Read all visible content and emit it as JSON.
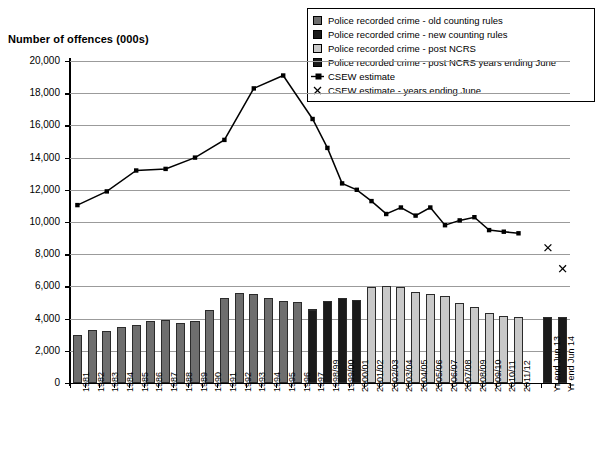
{
  "axis": {
    "y_title": "Number of offences (000s)",
    "y_ticks": [
      "0",
      "2,000",
      "4,000",
      "6,000",
      "8,000",
      "10,000",
      "12,000",
      "14,000",
      "16,000",
      "18,000",
      "20,000"
    ]
  },
  "legend": {
    "items": [
      {
        "label": "Police recorded crime - old counting rules",
        "marker": "square-swatch",
        "color": "#6e6e6e"
      },
      {
        "label": "Police recorded crime - new counting rules",
        "marker": "square-swatch",
        "color": "#1a1a1a"
      },
      {
        "label": "Police recorded crime - post NCRS",
        "marker": "square-swatch",
        "color": "#c9c9c9"
      },
      {
        "label": "Police recorded crime - post NCRS years ending June",
        "marker": "square-swatch",
        "color": "#1a1a1a"
      },
      {
        "label": "CSEW estimate",
        "marker": "line-point-marker",
        "color": "#000000"
      },
      {
        "label": "CSEW estimate - years ending June",
        "marker": "cross-marker",
        "color": "#000000"
      }
    ]
  },
  "chart_data": {
    "type": "bar",
    "title": "",
    "xlabel": "",
    "ylabel": "Number of offences (000s)",
    "ylim": [
      0,
      20000
    ],
    "grid": true,
    "legend_position": "top-right",
    "categories": [
      "1981",
      "1982",
      "1983",
      "1984",
      "1985",
      "1986",
      "1987",
      "1988",
      "1989",
      "1990",
      "1991",
      "1992",
      "1993",
      "1994",
      "1995",
      "1996",
      "1997",
      "1998/99",
      "1999/00",
      "2000/01",
      "2001/02",
      "2002/03",
      "2003/04",
      "2004/05",
      "2005/06",
      "2006/07",
      "2007/08",
      "2008/09",
      "2009/10",
      "2010/11",
      "2011/12",
      "",
      "Yr end Jun 13",
      "Yr end Jun 14"
    ],
    "series": [
      {
        "name": "Police recorded crime - old counting rules",
        "type": "bar",
        "color": "#6e6e6e",
        "values": [
          2963,
          3262,
          3247,
          3499,
          3612,
          3847,
          3892,
          3716,
          3870,
          4544,
          5276,
          5592,
          5526,
          5253,
          5100,
          5036,
          4598,
          null,
          null,
          null,
          null,
          null,
          null,
          null,
          null,
          null,
          null,
          null,
          null,
          null,
          null,
          null,
          null,
          null
        ]
      },
      {
        "name": "Police recorded crime - new counting rules",
        "type": "bar",
        "color": "#1a1a1a",
        "values": [
          null,
          null,
          null,
          null,
          null,
          null,
          null,
          null,
          null,
          null,
          null,
          null,
          null,
          null,
          null,
          null,
          4545,
          5109,
          5301,
          5171,
          5527,
          null,
          null,
          null,
          null,
          null,
          null,
          null,
          null,
          null,
          null,
          null,
          null,
          null
        ]
      },
      {
        "name": "Police recorded crime - post NCRS",
        "type": "bar",
        "color": "#c9c9c9",
        "values": [
          null,
          null,
          null,
          null,
          null,
          null,
          null,
          null,
          null,
          null,
          null,
          null,
          null,
          null,
          null,
          null,
          null,
          null,
          null,
          null,
          5975,
          6014,
          5935,
          5638,
          5555,
          5428,
          4951,
          4703,
          4338,
          4151,
          4101,
          null,
          null,
          null
        ]
      },
      {
        "name": "Police recorded crime - post NCRS years ending June",
        "type": "bar",
        "color": "#1a1a1a",
        "values": [
          null,
          null,
          null,
          null,
          null,
          null,
          null,
          null,
          null,
          null,
          null,
          null,
          null,
          null,
          null,
          null,
          null,
          null,
          null,
          null,
          null,
          null,
          null,
          null,
          null,
          null,
          null,
          null,
          null,
          null,
          null,
          null,
          4100,
          4090
        ]
      },
      {
        "name": "CSEW estimate",
        "type": "line",
        "color": "#000000",
        "marker": "square",
        "values": [
          11050,
          null,
          11900,
          null,
          13200,
          null,
          13300,
          null,
          14000,
          null,
          15100,
          null,
          18300,
          null,
          19100,
          null,
          16400,
          14600,
          12400,
          12000,
          11300,
          10500,
          10900,
          10400,
          10900,
          9800,
          10100,
          10300,
          9500,
          9400,
          9300,
          null,
          null,
          null
        ]
      },
      {
        "name": "CSEW estimate - years ending June",
        "type": "scatter",
        "color": "#000000",
        "marker": "x",
        "values": [
          null,
          null,
          null,
          null,
          null,
          null,
          null,
          null,
          null,
          null,
          null,
          null,
          null,
          null,
          null,
          null,
          null,
          null,
          null,
          null,
          null,
          null,
          null,
          null,
          null,
          null,
          null,
          null,
          null,
          null,
          null,
          null,
          8400,
          7100
        ]
      }
    ]
  }
}
